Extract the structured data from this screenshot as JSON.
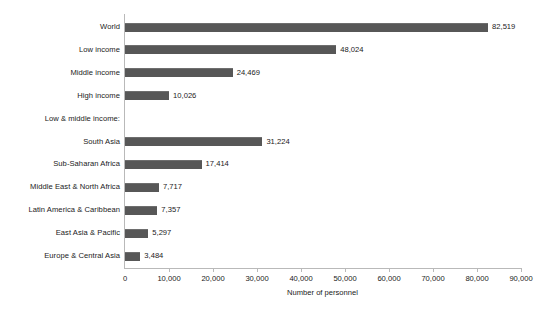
{
  "chart_data": {
    "type": "bar",
    "orientation": "horizontal",
    "title": "",
    "xlabel": "Number of personnel",
    "ylabel": "",
    "xlim": [
      0,
      90000
    ],
    "xticks": [
      0,
      10000,
      20000,
      30000,
      40000,
      50000,
      60000,
      70000,
      80000,
      90000
    ],
    "xtick_labels": [
      "0",
      "10,000",
      "20,000",
      "30,000",
      "40,000",
      "50,000",
      "60,000",
      "70,000",
      "80,000",
      "90,000"
    ],
    "grid": false,
    "legend": false,
    "bar_color": "#575757",
    "axis_color": "#b9b9b9",
    "background": "#ffffff",
    "categories": [
      "World",
      "Low income",
      "Middle income",
      "High income",
      "Low & middle income:",
      "South Asia",
      "Sub-Saharan Africa",
      "Middle East & North Africa",
      "Latin America & Caribbean",
      "East Asia & Pacific",
      "Europe & Central Asia"
    ],
    "values": [
      82519,
      48024,
      24469,
      10026,
      null,
      31224,
      17414,
      7717,
      7357,
      5297,
      3484
    ],
    "value_labels": [
      "82,519",
      "48,024",
      "24,469",
      "10,026",
      "",
      "31,224",
      "17,414",
      "7,717",
      "7,357",
      "5,297",
      "3,484"
    ],
    "rows": [
      {
        "label": "World",
        "value": 82519,
        "value_label": "82,519",
        "is_header": false
      },
      {
        "label": "Low income",
        "value": 48024,
        "value_label": "48,024",
        "is_header": false
      },
      {
        "label": "Middle income",
        "value": 24469,
        "value_label": "24,469",
        "is_header": false
      },
      {
        "label": "High income",
        "value": 10026,
        "value_label": "10,026",
        "is_header": false
      },
      {
        "label": "Low & middle income:",
        "value": null,
        "value_label": "",
        "is_header": true
      },
      {
        "label": "South Asia",
        "value": 31224,
        "value_label": "31,224",
        "is_header": false
      },
      {
        "label": "Sub-Saharan Africa",
        "value": 17414,
        "value_label": "17,414",
        "is_header": false
      },
      {
        "label": "Middle East & North Africa",
        "value": 7717,
        "value_label": "7,717",
        "is_header": false
      },
      {
        "label": "Latin America & Caribbean",
        "value": 7357,
        "value_label": "7,357",
        "is_header": false
      },
      {
        "label": "East Asia & Pacific",
        "value": 5297,
        "value_label": "5,297",
        "is_header": false
      },
      {
        "label": "Europe & Central Asia",
        "value": 3484,
        "value_label": "3,484",
        "is_header": false
      }
    ]
  }
}
